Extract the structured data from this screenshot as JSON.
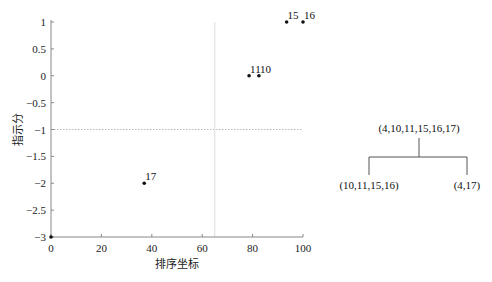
{
  "chart_data": [
    {
      "type": "scatter",
      "title": "",
      "xlabel": "排序坐标",
      "ylabel": "指示分",
      "xlim": [
        0,
        100
      ],
      "ylim": [
        -3,
        1
      ],
      "xticks": [
        0,
        20,
        40,
        60,
        80,
        100
      ],
      "xtick_labels": [
        "0",
        "20",
        "40",
        "60",
        "80",
        "100"
      ],
      "yticks": [
        1,
        0.5,
        0,
        -0.5,
        -1,
        -1.5,
        -2,
        -2.5,
        -3
      ],
      "ytick_labels": [
        "1",
        "0.5",
        "0",
        "−0.5",
        "−1",
        "−1.5",
        "−2",
        "−2.5",
        "−3"
      ],
      "grid": false,
      "points": [
        {
          "label": "15",
          "x": 93.5,
          "y": 1
        },
        {
          "label": "16",
          "x": 100,
          "y": 1
        },
        {
          "label": "11",
          "x": 78.6,
          "y": 0
        },
        {
          "label": "10",
          "x": 82.5,
          "y": 0
        },
        {
          "label": "17",
          "x": 37,
          "y": -2
        },
        {
          "label": "",
          "x": 0,
          "y": -3
        }
      ],
      "reference_lines": [
        {
          "orientation": "horizontal",
          "value": -1,
          "style": "dotted"
        },
        {
          "orientation": "vertical",
          "value": 65,
          "style": "solid-light"
        }
      ]
    },
    {
      "type": "tree",
      "root": "(4,10,11,15,16,17)",
      "children": [
        "(10,11,15,16)",
        "(4,17)"
      ]
    }
  ]
}
